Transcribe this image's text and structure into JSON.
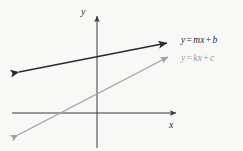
{
  "figure": {
    "name": "two-lines-coordinate-plane",
    "background_color": "#f8f8f7"
  },
  "axes": {
    "x_label": "x",
    "y_label": "y",
    "color": "#3a3a3a",
    "origin": {
      "x": 97,
      "y": 113
    },
    "x_axis": {
      "x_start": 12,
      "x_end": 180,
      "y": 113,
      "arrow": "right"
    },
    "y_axis": {
      "y_start": 12,
      "y_end": 148,
      "x": 97,
      "arrow": "up"
    }
  },
  "lines": [
    {
      "id": "line-dark",
      "label": "y = mx + b",
      "label_parts": {
        "y": "y",
        "eq": "=",
        "m": "m",
        "x": "x",
        "plus": "+",
        "b": "b"
      },
      "color": "#2a2a2a",
      "stroke_width": 1.6,
      "arrows": "both",
      "from": {
        "x": 14,
        "y": 73
      },
      "to": {
        "x": 172,
        "y": 42
      },
      "slope_sign": "positive",
      "description": "shallow positive slope, positive y-intercept"
    },
    {
      "id": "line-gray",
      "label": "y = kx + c",
      "label_parts": {
        "y": "y",
        "eq": "=",
        "k": "k",
        "x": "x",
        "plus": "+",
        "c": "c"
      },
      "color": "#a0a0a0",
      "stroke_width": 1.4,
      "arrows": "both",
      "from": {
        "x": 14,
        "y": 138
      },
      "to": {
        "x": 172,
        "y": 55
      },
      "slope_sign": "positive",
      "description": "steeper positive slope, negative y-intercept, crosses x-axis left of origin"
    }
  ]
}
